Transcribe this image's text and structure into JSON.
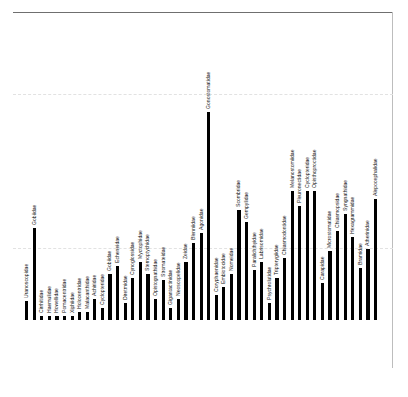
{
  "figure": {
    "kind": "bar-chart",
    "background": "#ffffff",
    "bar_color": "#000000",
    "frame_color": "#6f6f6f",
    "gridline_color": "#e2e2e2",
    "label_orientation": "vertical-rotated-90"
  },
  "chart_data": {
    "type": "bar",
    "title": "",
    "xlabel": "",
    "ylabel": "",
    "grid": true,
    "legend": "none",
    "ylim": [
      0,
      100
    ],
    "gridlines": [
      44,
      76
    ],
    "categories": [
      "Uranoscopidae",
      "Gobiidae",
      "Cirrhitidae",
      "Haemulidae",
      "Howellidae",
      "Pomacentridae",
      "Xiphiidae",
      "Holocentridae",
      "Malacanthidae",
      "Achiridae",
      "Cyclopteridae",
      "Gobiidae",
      "Echeneidae",
      "Diretmidae",
      "Cynoglossidae",
      "Myctophidae",
      "Sternoptychidae",
      "Opistognathidae",
      "Stromateidae",
      "Gigantactinidae",
      "Neoscopelidae",
      "Zeidae",
      "Blenniidae",
      "Agonidae",
      "Gonostomatidae",
      "Coryphaenidae",
      "Embiotocidae",
      "Nomeidae",
      "Scombridae",
      "Gempylidae",
      "Paralichthyidae",
      "Labrisomidae",
      "Psychrolutidae",
      "Tripterygiidae",
      "Chiasmodontidae",
      "Melanostomiidae",
      "Pleuronectidae",
      "Cyclopteridae",
      "Opisthoproctidae",
      "Carapidae",
      "Microstomatidae",
      "Chiasmopsidae",
      "Syngnathidae",
      "Hexagrammidae",
      "Bramidae",
      "Atherinidae",
      "Alepocephalidae"
    ],
    "values": [
      9,
      44,
      2,
      2,
      2,
      2,
      2,
      4,
      4,
      10,
      6,
      22,
      26,
      8,
      20,
      28,
      22,
      10,
      19,
      6,
      10,
      28,
      37,
      42,
      100,
      12,
      16,
      22,
      53,
      47,
      24,
      28,
      8,
      20,
      30,
      62,
      55,
      62,
      62,
      18,
      33,
      43,
      51,
      40,
      25,
      34,
      58
    ]
  }
}
